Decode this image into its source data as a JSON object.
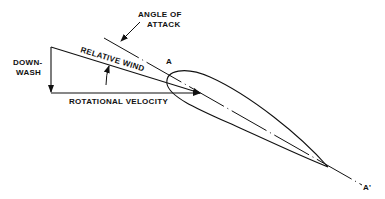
{
  "diagram": {
    "labels": {
      "angle_of_attack_line1": "ANGLE OF",
      "angle_of_attack_line2": "ATTACK",
      "relative_wind": "RELATIVE WIND",
      "downwash_line1": "DOWN-",
      "downwash_line2": "WASH",
      "rotational_velocity": "ROTATIONAL VELOCITY",
      "point_a": "A",
      "point_a_prime": "A'"
    },
    "colors": {
      "line": "#111111",
      "background": "#ffffff"
    }
  }
}
